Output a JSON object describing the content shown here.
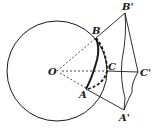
{
  "diagram": {
    "title": "",
    "colors": {
      "stroke": "#1a1a1a",
      "background": "#ffffff"
    },
    "circle": {
      "center": "O",
      "cx": 57,
      "cy": 71,
      "r": 50
    },
    "points": {
      "O": {
        "label": "O",
        "x": 57,
        "y": 71
      },
      "A": {
        "label": "A",
        "x": 86,
        "y": 89
      },
      "B": {
        "label": "B",
        "x": 96,
        "y": 38
      },
      "C": {
        "label": "C",
        "x": 107,
        "y": 71
      },
      "A_prime": {
        "label": "A'",
        "x": 124,
        "y": 110
      },
      "B_prime": {
        "label": "B'",
        "x": 125,
        "y": 13
      },
      "C_prime": {
        "label": "C'",
        "x": 138,
        "y": 72
      }
    },
    "segments": [
      {
        "from": "O",
        "to": "B",
        "style": "dashed"
      },
      {
        "from": "B",
        "to": "B'",
        "style": "solid"
      },
      {
        "from": "O",
        "to": "C",
        "style": "dashed"
      },
      {
        "from": "C",
        "to": "C'",
        "style": "solid"
      },
      {
        "from": "O",
        "to": "A",
        "style": "dashed"
      },
      {
        "from": "A",
        "to": "A'",
        "style": "solid"
      },
      {
        "from": "B'",
        "to": "C'",
        "style": "solid"
      },
      {
        "from": "C'",
        "to": "A'",
        "style": "solid"
      },
      {
        "from": "B'",
        "to": "A'",
        "style": "solid-curved"
      }
    ],
    "arcs": [
      {
        "name": "arc-AB",
        "style": "bold"
      },
      {
        "name": "arc-BCA",
        "style": "bold-dashed"
      }
    ]
  }
}
